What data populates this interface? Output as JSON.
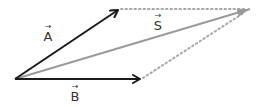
{
  "diagram": {
    "colors": {
      "operand": "#1a1a1a",
      "resultant": "#9a9a9a",
      "construction": "#a8a8a8",
      "label": "#333333"
    },
    "origin": [
      15,
      79
    ],
    "vectors": [
      {
        "name": "A",
        "label": "A",
        "arrow_glyph": "→",
        "from": [
          15,
          79
        ],
        "to": [
          118,
          10
        ],
        "role": "operand"
      },
      {
        "name": "B",
        "label": "B",
        "arrow_glyph": "→",
        "from": [
          15,
          79
        ],
        "to": [
          140,
          79
        ],
        "role": "operand"
      },
      {
        "name": "S",
        "label": "S",
        "arrow_glyph": "→",
        "from": [
          15,
          79
        ],
        "to": [
          250,
          9
        ],
        "role": "resultant"
      }
    ],
    "construction_lines": [
      {
        "from": [
          118,
          9
        ],
        "to": [
          248,
          9
        ],
        "style": "dotted"
      },
      {
        "from": [
          141,
          79
        ],
        "to": [
          248,
          11
        ],
        "style": "dotted"
      }
    ],
    "labels": {
      "A": {
        "text": "A",
        "arrow": "→",
        "pos": [
          41,
          24
        ]
      },
      "B": {
        "text": "B",
        "arrow": "→",
        "pos": [
          68,
          84
        ]
      },
      "S": {
        "text": "S",
        "arrow": "→",
        "pos": [
          151,
          13
        ]
      }
    }
  }
}
